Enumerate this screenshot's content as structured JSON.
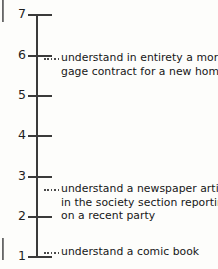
{
  "figure": {
    "type": "annotated-scale",
    "orientation": "vertical"
  },
  "axis": {
    "min": 1,
    "max": 7,
    "ticks": [
      {
        "value": "7",
        "y": 14
      },
      {
        "value": "6",
        "y": 55
      },
      {
        "value": "5",
        "y": 95
      },
      {
        "value": "4",
        "y": 135
      },
      {
        "value": "3",
        "y": 176
      },
      {
        "value": "2",
        "y": 216
      },
      {
        "value": "1",
        "y": 256
      }
    ]
  },
  "annotations": [
    {
      "id": "mortgage",
      "anchor_value": "6",
      "leader_y": 58,
      "text_top": 51,
      "lines": [
        "understand in entirety a mort-",
        "gage contract for a new home"
      ]
    },
    {
      "id": "newspaper",
      "anchor_value": "3",
      "leader_y": 189,
      "text_top": 182,
      "lines": [
        "understand a newspaper article",
        "in the society section reporting",
        "on a recent party"
      ]
    },
    {
      "id": "comic",
      "anchor_value": "1",
      "leader_y": 252,
      "text_top": 245,
      "lines": [
        "understand a comic book"
      ]
    }
  ],
  "colors": {
    "ink": "#1f1f1f",
    "rule": "#3a3a3a",
    "paper": "#fdfdfb"
  }
}
